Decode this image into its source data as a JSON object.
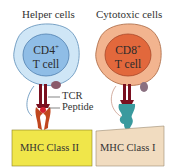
{
  "diagram": {
    "panels": [
      {
        "title": "Helper cells",
        "cell_label_line1": "CD4",
        "cell_label_sup": "+",
        "cell_label_line2": "T cell",
        "mhc_label": "MHC Class II",
        "colors": {
          "cell_outer": "#cfe6f6",
          "cell_inner": "#8fbde6",
          "mhc_box": "#f0e64a"
        }
      },
      {
        "title": "Cytotoxic cells",
        "cell_label_line1": "CD8",
        "cell_label_sup": "+",
        "cell_label_line2": "T cell",
        "mhc_label": "MHC Class I",
        "colors": {
          "cell_outer": "#f2b48f",
          "cell_inner": "#e2683c",
          "mhc_box": "#f1dcc0"
        }
      }
    ],
    "annotations": {
      "tcr": "TCR",
      "peptide": "Peptide"
    },
    "colors": {
      "tcr": "#7a1020",
      "peptide": "#d42030",
      "mhc_molecule_class1": "#3a9a9e",
      "accessory": "#8a5a6a"
    }
  }
}
